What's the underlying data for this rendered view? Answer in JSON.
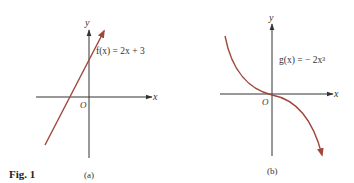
{
  "figure": {
    "caption": "Fig.  1",
    "curve_color": "#a0463a",
    "axis_color": "#333333",
    "panels": [
      {
        "id": "a",
        "sublabel": "(a)",
        "function_label": "f(x) = 2x + 3",
        "x_axis_label": "x",
        "y_axis_label": "y",
        "origin_label": "O",
        "curve_type": "line"
      },
      {
        "id": "b",
        "sublabel": "(b)",
        "function_label": "g(x) = − 2x³",
        "x_axis_label": "x",
        "y_axis_label": "y",
        "origin_label": "O",
        "curve_type": "cubic"
      }
    ]
  }
}
